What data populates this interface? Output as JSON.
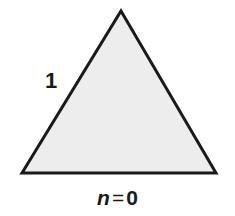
{
  "figure": {
    "name": "koch-snowflake-initiator-triangle",
    "background_color": "#ffffff",
    "caption": {
      "variable": "n",
      "equals": "=",
      "value": "0",
      "full_text": "n = 0"
    },
    "labels": {
      "side_length": "1"
    },
    "shape": {
      "type": "triangle",
      "description": "equilateral triangle",
      "fill_color": "#ededed",
      "stroke_color": "#1a1a1a",
      "stroke_width": 3,
      "vertices": [
        {
          "name": "apex",
          "x": 121,
          "y": 11
        },
        {
          "name": "bottom-right",
          "x": 216,
          "y": 173
        },
        {
          "name": "bottom-left",
          "x": 22,
          "y": 173
        }
      ],
      "points_attr": "121,11 216,173 22,173"
    }
  }
}
